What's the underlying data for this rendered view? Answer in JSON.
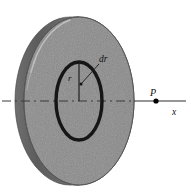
{
  "figure": {
    "caption_present": false,
    "background_color": "#ffffff",
    "labels": {
      "ring_radius": "r",
      "ring_width": "dr",
      "field_point": "P",
      "axis": "x"
    },
    "colors": {
      "disk_face": "#8b8b8b",
      "disk_rim_dark": "#5e5e5e",
      "disk_rim_light": "#b4b4b4",
      "ring_stroke": "#1a1a1a",
      "axis_stroke": "#333333",
      "point_fill": "#000000",
      "leader_stroke": "#222222"
    },
    "geometry": {
      "disk_center_x": 79,
      "disk_center_y": 101,
      "disk_radius_x": 55,
      "disk_radius_y": 84,
      "ring_radius_x": 23,
      "ring_radius_y": 39,
      "axis_y": 101,
      "axis_start_x": 2,
      "axis_end_x": 186,
      "point_p_x": 156,
      "point_p_y": 101
    }
  }
}
